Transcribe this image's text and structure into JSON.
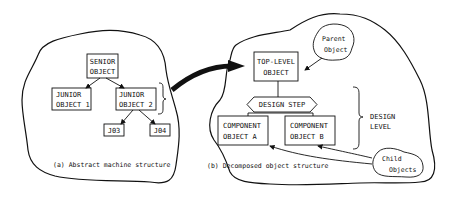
{
  "panel_a": {
    "caption": "(a) Abstract machine structure",
    "senior": [
      "SENIOR",
      "OBJECT"
    ],
    "junior1": [
      "JUNIOR",
      "OBJECT 1"
    ],
    "junior2": [
      "JUNIOR",
      "OBJECT 2"
    ],
    "j03": "J03",
    "j04": "J04"
  },
  "panel_b": {
    "caption": "(b)  Decomposed object structure",
    "top_level": [
      "TOP-LEVEL",
      "OBJECT"
    ],
    "design_step": "DESIGN STEP",
    "component_a": [
      "COMPONENT",
      "OBJECT A"
    ],
    "component_b": [
      "COMPONENT",
      "OBJECT B"
    ],
    "design_level": [
      "DESIGN",
      "LEVEL"
    ],
    "parent_blob": [
      "Parent",
      "Object"
    ],
    "child_blob": [
      "Child",
      "Objects"
    ]
  }
}
